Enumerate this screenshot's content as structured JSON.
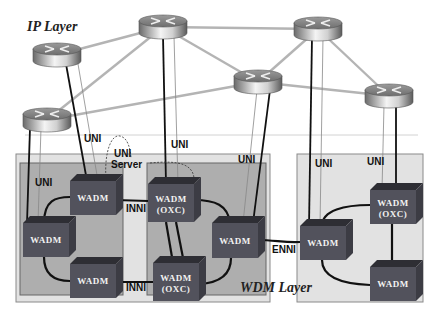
{
  "title_ip": "IP Layer",
  "title_wdm": "WDM Layer",
  "colors": {
    "router_link": "#b4b4b4",
    "uni_thick": "#111111",
    "uni_thin": "#777777",
    "wdm_outer_bg": "#e2e2e2",
    "wdm_inner_bg": "#aeaeae",
    "node_front": "#52525c",
    "node_top": "#2e2e34",
    "node_side": "#3c3c44",
    "divider": "#cfcfcf"
  },
  "routers": [
    {
      "id": "R1",
      "cx": 57,
      "cy": 55
    },
    {
      "id": "R2",
      "cx": 163,
      "cy": 27
    },
    {
      "id": "R3",
      "cx": 318,
      "cy": 29
    },
    {
      "id": "R4",
      "cx": 258,
      "cy": 82
    },
    {
      "id": "R5",
      "cx": 389,
      "cy": 96
    },
    {
      "id": "R6",
      "cx": 47,
      "cy": 120
    }
  ],
  "router_links": [
    [
      "R1",
      "R2"
    ],
    [
      "R6",
      "R2"
    ],
    [
      "R6",
      "R4"
    ],
    [
      "R2",
      "R3"
    ],
    [
      "R2",
      "R4"
    ],
    [
      "R4",
      "R3"
    ],
    [
      "R4",
      "R5"
    ],
    [
      "R3",
      "R5"
    ]
  ],
  "wdm_regions": [
    {
      "id": "left-domain",
      "x": 16,
      "y": 154,
      "w": 254,
      "h": 148,
      "inner": [
        {
          "x": 20,
          "y": 163,
          "w": 103,
          "h": 132
        },
        {
          "x": 147,
          "y": 163,
          "w": 119,
          "h": 132
        }
      ]
    },
    {
      "id": "right-domain",
      "x": 297,
      "y": 154,
      "w": 126,
      "h": 148,
      "inner": []
    }
  ],
  "nodes": [
    {
      "id": "A",
      "x": 70,
      "y": 181,
      "w": 46,
      "h": 34,
      "label": "WADM",
      "sub": ""
    },
    {
      "id": "B",
      "x": 23,
      "y": 223,
      "w": 46,
      "h": 34,
      "label": "WADM",
      "sub": ""
    },
    {
      "id": "C",
      "x": 70,
      "y": 264,
      "w": 46,
      "h": 34,
      "label": "WADM",
      "sub": ""
    },
    {
      "id": "D",
      "x": 148,
      "y": 184,
      "w": 46,
      "h": 38,
      "label": "WADM",
      "sub": "(OXC)"
    },
    {
      "id": "E",
      "x": 212,
      "y": 223,
      "w": 46,
      "h": 35,
      "label": "WADM",
      "sub": ""
    },
    {
      "id": "F",
      "x": 153,
      "y": 263,
      "w": 46,
      "h": 38,
      "label": "WADM",
      "sub": "(OXC)"
    },
    {
      "id": "G",
      "x": 300,
      "y": 226,
      "w": 46,
      "h": 34,
      "label": "WADM",
      "sub": ""
    },
    {
      "id": "H",
      "x": 370,
      "y": 190,
      "w": 46,
      "h": 34,
      "label": "WADM",
      "sub": "(OXC)"
    },
    {
      "id": "I",
      "x": 370,
      "y": 267,
      "w": 46,
      "h": 34,
      "label": "WADM",
      "sub": ""
    }
  ],
  "labels": {
    "uni_1": {
      "text": "UNI",
      "x": 84,
      "y": 142
    },
    "uni_2": {
      "text": "UNI",
      "x": 171,
      "y": 148
    },
    "uni_server_1": {
      "text": "UNI",
      "x": 114,
      "y": 157
    },
    "uni_server_2": {
      "text": "Server",
      "x": 111,
      "y": 168
    },
    "uni_3": {
      "text": "UNI",
      "x": 238,
      "y": 163
    },
    "uni_4": {
      "text": "UNI",
      "x": 35,
      "y": 186
    },
    "uni_5": {
      "text": "UNI",
      "x": 315,
      "y": 167
    },
    "uni_6": {
      "text": "UNI",
      "x": 367,
      "y": 165
    },
    "inni_1": {
      "text": "INNI",
      "x": 126,
      "y": 212
    },
    "inni_2": {
      "text": "INNI",
      "x": 126,
      "y": 291
    },
    "enni": {
      "text": "ENNI",
      "x": 272,
      "y": 249
    }
  }
}
